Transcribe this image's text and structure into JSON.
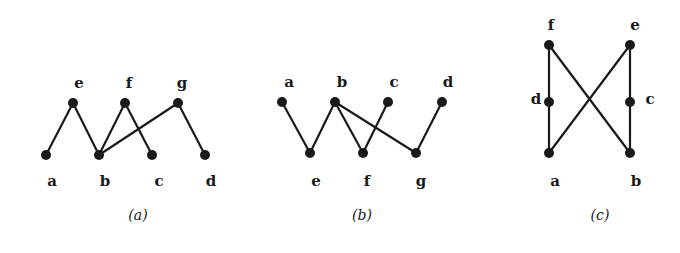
{
  "figure": {
    "panels": [
      {
        "id": "a",
        "caption": "(a)",
        "caption_pos": [
          138,
          220
        ],
        "nodes": [
          {
            "id": "e",
            "label": "e",
            "x": 73,
            "y": 103,
            "lx": 79,
            "ly": 88,
            "anchor": "middle"
          },
          {
            "id": "f",
            "label": "f",
            "x": 125,
            "y": 103,
            "lx": 129,
            "ly": 88,
            "anchor": "middle"
          },
          {
            "id": "g",
            "label": "g",
            "x": 178,
            "y": 103,
            "lx": 182,
            "ly": 88,
            "anchor": "middle"
          },
          {
            "id": "a",
            "label": "a",
            "x": 46,
            "y": 155,
            "lx": 52,
            "ly": 186,
            "anchor": "middle"
          },
          {
            "id": "b",
            "label": "b",
            "x": 99,
            "y": 155,
            "lx": 105,
            "ly": 186,
            "anchor": "middle"
          },
          {
            "id": "c",
            "label": "c",
            "x": 152,
            "y": 155,
            "lx": 159,
            "ly": 186,
            "anchor": "middle"
          },
          {
            "id": "d",
            "label": "d",
            "x": 205,
            "y": 155,
            "lx": 211,
            "ly": 186,
            "anchor": "middle"
          }
        ],
        "edges": [
          [
            "a",
            "e"
          ],
          [
            "e",
            "b"
          ],
          [
            "b",
            "f"
          ],
          [
            "f",
            "c"
          ],
          [
            "b",
            "g"
          ],
          [
            "g",
            "d"
          ]
        ]
      },
      {
        "id": "b",
        "caption": "(b)",
        "caption_pos": [
          362,
          220
        ],
        "nodes": [
          {
            "id": "a",
            "label": "a",
            "x": 282,
            "y": 102,
            "lx": 289,
            "ly": 87,
            "anchor": "middle"
          },
          {
            "id": "b",
            "label": "b",
            "x": 335,
            "y": 102,
            "lx": 342,
            "ly": 87,
            "anchor": "middle"
          },
          {
            "id": "c",
            "label": "c",
            "x": 388,
            "y": 102,
            "lx": 394,
            "ly": 87,
            "anchor": "middle"
          },
          {
            "id": "d",
            "label": "d",
            "x": 442,
            "y": 102,
            "lx": 448,
            "ly": 87,
            "anchor": "middle"
          },
          {
            "id": "e",
            "label": "e",
            "x": 310,
            "y": 153,
            "lx": 316,
            "ly": 186,
            "anchor": "middle"
          },
          {
            "id": "f",
            "label": "f",
            "x": 363,
            "y": 153,
            "lx": 367,
            "ly": 186,
            "anchor": "middle"
          },
          {
            "id": "g",
            "label": "g",
            "x": 416,
            "y": 153,
            "lx": 421,
            "ly": 186,
            "anchor": "middle"
          }
        ],
        "edges": [
          [
            "a",
            "e"
          ],
          [
            "e",
            "b"
          ],
          [
            "b",
            "f"
          ],
          [
            "b",
            "g"
          ],
          [
            "c",
            "f"
          ],
          [
            "d",
            "g"
          ]
        ]
      },
      {
        "id": "c",
        "caption": "(c)",
        "caption_pos": [
          600,
          220
        ],
        "nodes": [
          {
            "id": "f",
            "label": "f",
            "x": 549,
            "y": 45,
            "lx": 551,
            "ly": 30,
            "anchor": "middle"
          },
          {
            "id": "e",
            "label": "e",
            "x": 630,
            "y": 45,
            "lx": 635,
            "ly": 30,
            "anchor": "middle"
          },
          {
            "id": "d",
            "label": "d",
            "x": 549,
            "y": 102,
            "lx": 536,
            "ly": 104,
            "anchor": "middle"
          },
          {
            "id": "c",
            "label": "c",
            "x": 630,
            "y": 102,
            "lx": 650,
            "ly": 104,
            "anchor": "middle"
          },
          {
            "id": "a",
            "label": "a",
            "x": 549,
            "y": 153,
            "lx": 555,
            "ly": 186,
            "anchor": "middle"
          },
          {
            "id": "b",
            "label": "b",
            "x": 630,
            "y": 153,
            "lx": 636,
            "ly": 186,
            "anchor": "middle"
          }
        ],
        "edges": [
          [
            "f",
            "d"
          ],
          [
            "d",
            "a"
          ],
          [
            "e",
            "c"
          ],
          [
            "c",
            "b"
          ],
          [
            "f",
            "b"
          ],
          [
            "e",
            "a"
          ]
        ]
      }
    ]
  }
}
